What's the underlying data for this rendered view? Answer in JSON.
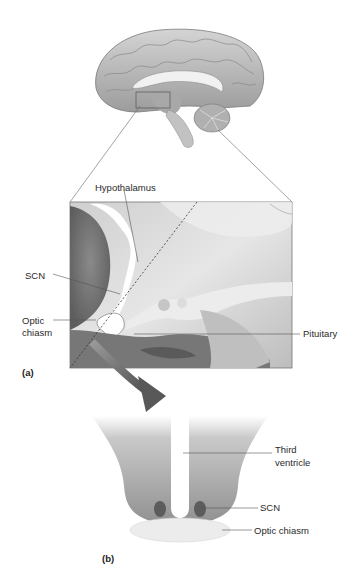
{
  "figure": {
    "panel_a": {
      "label": "(a)",
      "annotations": [
        {
          "id": "hypothalamus",
          "text": "Hypothalamus"
        },
        {
          "id": "scn",
          "text": "SCN"
        },
        {
          "id": "optic_chiasm",
          "text": "Optic\nchiasm",
          "line1": "Optic",
          "line2": "chiasm"
        },
        {
          "id": "pituitary",
          "text": "Pituitary"
        }
      ]
    },
    "panel_b": {
      "label": "(b)",
      "annotations": [
        {
          "id": "third_ventricle",
          "text": "Third ventricle",
          "line1": "Third",
          "line2": "ventricle"
        },
        {
          "id": "scn",
          "text": "SCN"
        },
        {
          "id": "optic_chiasm",
          "text": "Optic chiasm"
        }
      ]
    },
    "colors": {
      "background": "#ffffff",
      "brain_gray": "#b8b8b8",
      "tissue_gray": "#9a9a9a",
      "scn_dark": "#5a5a5a",
      "chiasm_light": "#e8e8e8",
      "arrow_gray": "#6e6e6e",
      "label_text": "#2a2a2a"
    }
  }
}
